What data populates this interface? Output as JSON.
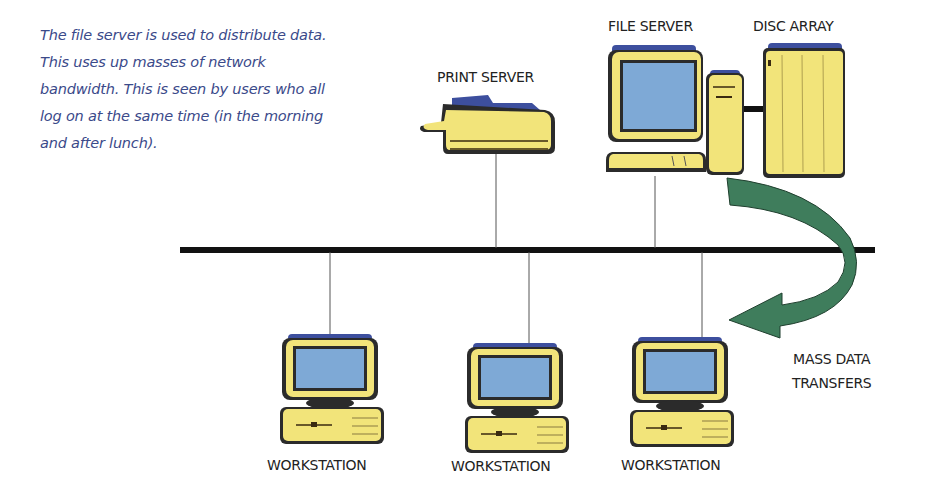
{
  "caption": {
    "lines": [
      "The file server is used to distribute data.",
      "This uses up masses of network",
      "bandwidth. This is seen by users who all",
      "log on at the same time (in the morning",
      "and after lunch)."
    ]
  },
  "nodes": {
    "print_server": {
      "label": "PRINT SERVER"
    },
    "file_server": {
      "label": "FILE SERVER"
    },
    "disc_array": {
      "label": "DISC ARRAY"
    },
    "workstations": [
      {
        "label": "WORKSTATION"
      },
      {
        "label": "WORKSTATION"
      },
      {
        "label": "WORKSTATION"
      }
    ]
  },
  "arrow": {
    "label_line1": "MASS DATA",
    "label_line2": "TRANSFERS"
  },
  "colors": {
    "device_yellow": "#f2e47a",
    "device_blue": "#3d4f9e",
    "screen_blue": "#7ea9d6",
    "outline": "#2b2b2b",
    "arrow_green": "#3f7d5c",
    "caption_blue": "#3b4a8a",
    "bus": "#111111"
  }
}
